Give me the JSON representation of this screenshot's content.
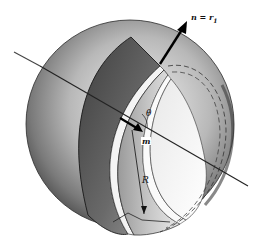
{
  "figure": {
    "labels": {
      "normal": "n = r",
      "normal_subscript": "1",
      "angle": "θ",
      "unit_vector": "m",
      "radius": "R"
    },
    "colors": {
      "background": "#ffffff",
      "ink": "#111111",
      "shade_dark": "#4a4a4a",
      "shade_mid": "#8c8c8c",
      "shade_light": "#d8d8d8"
    }
  }
}
